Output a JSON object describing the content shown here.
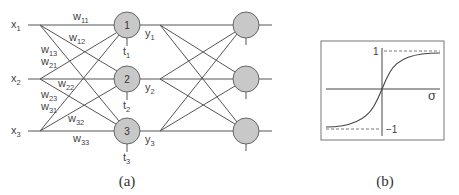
{
  "figure_a": {
    "caption": "(a)",
    "inputs": [
      {
        "base": "x",
        "sub": "1"
      },
      {
        "base": "x",
        "sub": "2"
      },
      {
        "base": "x",
        "sub": "3"
      }
    ],
    "weights": [
      {
        "base": "w",
        "sub": "11"
      },
      {
        "base": "w",
        "sub": "12"
      },
      {
        "base": "w",
        "sub": "13"
      },
      {
        "base": "w",
        "sub": "21"
      },
      {
        "base": "w",
        "sub": "22"
      },
      {
        "base": "w",
        "sub": "23"
      },
      {
        "base": "w",
        "sub": "31"
      },
      {
        "base": "w",
        "sub": "32"
      },
      {
        "base": "w",
        "sub": "33"
      }
    ],
    "hidden_nodes": [
      {
        "label": "1"
      },
      {
        "label": "2"
      },
      {
        "label": "3"
      }
    ],
    "thresholds": [
      {
        "base": "t",
        "sub": "1"
      },
      {
        "base": "t",
        "sub": "2"
      },
      {
        "base": "t",
        "sub": "3"
      }
    ],
    "outputs": [
      {
        "base": "y",
        "sub": "1"
      },
      {
        "base": "y",
        "sub": "2"
      },
      {
        "base": "y",
        "sub": "3"
      }
    ],
    "node_fill": "#c8c8c8",
    "line_color": "#555555"
  },
  "figure_b": {
    "caption": "(b)",
    "upper_label": "1",
    "lower_label": "−1",
    "axis_label": "σ",
    "curve": "sigmoid (tanh-like)"
  }
}
